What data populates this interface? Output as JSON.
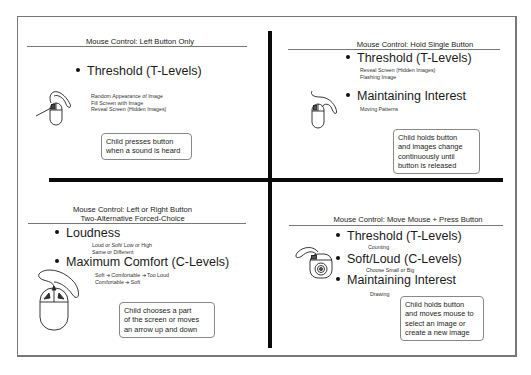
{
  "panels": {
    "top_left": {
      "title_lines": [
        "Mouse Control:  Left Button Only"
      ],
      "bullets": [
        {
          "label": "Threshold (T-Levels)",
          "items": [
            "Random Appearance of Image",
            "Fill Screen with Image",
            "Reveal Screen (Hidden Images)"
          ]
        }
      ],
      "note_lines": [
        "Child presses button",
        "when a sound is heard"
      ],
      "icon": "mouse-left-button-icon"
    },
    "top_right": {
      "title_lines": [
        "Mouse Control:  Hold Single Button"
      ],
      "bullets": [
        {
          "label": "Threshold (T-Levels)",
          "items": [
            "Reveal Screen (Hidden Images)",
            "Flashing Image"
          ]
        },
        {
          "label": "Maintaining Interest",
          "items": [
            "Moving Patterns"
          ]
        }
      ],
      "note_lines": [
        "Child holds button",
        "and images change",
        "continuously until",
        "button is released"
      ],
      "icon": "mouse-hold-button-icon"
    },
    "bottom_left": {
      "title_lines": [
        "Mouse Control: Left or Right Button",
        "Two-Alternative Forced-Choice"
      ],
      "bullets": [
        {
          "label": "Loudness",
          "items": [
            "Loud or Soft/ Low or High",
            "Same or Different"
          ]
        },
        {
          "label": "Maximum Comfort (C-Levels)",
          "items": [
            "Soft ➔ Comfortable ➔ Too Loud",
            "Comfortable ➔ Soft"
          ]
        }
      ],
      "note_lines": [
        "Child chooses a part",
        "of the screen or moves",
        "an arrow up and down"
      ],
      "icon": "mouse-left-right-button-icon"
    },
    "bottom_right": {
      "title_lines": [
        "Mouse Control: Move Mouse + Press Button"
      ],
      "bullets": [
        {
          "label": "Threshold (T-Levels)",
          "items": [
            "Counting"
          ]
        },
        {
          "label": "Soft/Loud (C-Levels)",
          "items": [
            "Choose Small or Big"
          ]
        },
        {
          "label": "Maintaining Interest",
          "items": [
            "Drawing"
          ]
        }
      ],
      "note_lines": [
        "Child holds button",
        "and moves mouse to",
        "select an image or",
        "create a new image"
      ],
      "icon": "mouse-trackball-icon"
    }
  }
}
